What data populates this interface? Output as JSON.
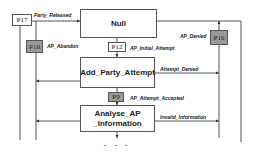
{
  "states": {
    "null": "Null",
    "add_party_attempt": "Add_Party_Attempt",
    "analyse_line1": "Analyse_AP",
    "analyse_line2": "_Information"
  },
  "places": {
    "p17": "P17",
    "p10": "P10",
    "p12": "P12",
    "p9": "P9",
    "p16": "P16"
  },
  "transitions": {
    "party_released": "Party_Released",
    "ap_abandon": "AP_Abandon",
    "ap_initial_attempt": "AP_Initial_Attempt",
    "ap_denied": "AP_Denied",
    "attempt_denied": "Attempt_Denied",
    "ap_attempt_accepted": "AP_Attempt_Accepted",
    "invalid_information": "Invalid_Information"
  },
  "continuation": ". . ."
}
